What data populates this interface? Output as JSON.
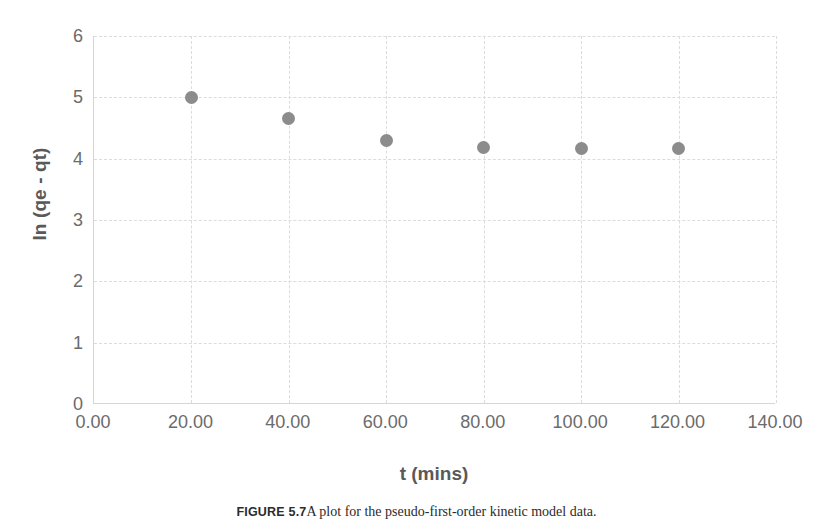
{
  "figure": {
    "caption_label": "FIGURE 5.7",
    "caption_text": "A plot for the pseudo-first-order kinetic model data."
  },
  "chart_data": {
    "type": "scatter",
    "title": "",
    "subtitle": "",
    "xlabel": "t (mins)",
    "ylabel": "ln (qe - qt)",
    "xlim": [
      0,
      140
    ],
    "ylim": [
      0,
      6
    ],
    "xticks": [
      0,
      20,
      40,
      60,
      80,
      100,
      120,
      140
    ],
    "yticks": [
      0,
      1,
      2,
      3,
      4,
      5,
      6
    ],
    "xtick_labels": [
      "0.00",
      "20.00",
      "40.00",
      "60.00",
      "80.00",
      "100.00",
      "120.00",
      "140.00"
    ],
    "ytick_labels": [
      "0",
      "1",
      "2",
      "3",
      "4",
      "5",
      "6"
    ],
    "grid": true,
    "grid_style": "dashed",
    "legend": false,
    "legend_position": "none",
    "marker_color": "#8c8c8c",
    "marker_shape": "circle",
    "series": [
      {
        "name": "ln (qe - qt)",
        "x": [
          20,
          40,
          60,
          80,
          100,
          120
        ],
        "y": [
          5.0,
          4.65,
          4.29,
          4.18,
          4.16,
          4.16
        ]
      }
    ]
  },
  "colors": {
    "marker": "#8c8c8c",
    "gridline": "#dcdcdc",
    "axis_line": "#d6d6d6",
    "tick_text": "#6b6b6b",
    "axis_title_text": "#595959",
    "background": "#ffffff"
  }
}
